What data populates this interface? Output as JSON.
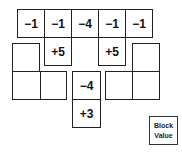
{
  "diagram": {
    "top_row": [
      "−1",
      "−1",
      "−4",
      "−1",
      "−1"
    ],
    "left_hanger": [
      "+5"
    ],
    "right_hanger": [
      "+5"
    ],
    "center_column": [
      "−4",
      "+3"
    ],
    "left_block_cells": [
      "",
      "",
      ""
    ],
    "right_block_cells": [
      "",
      "",
      ""
    ],
    "legend": {
      "line1": "Block",
      "line2": "Value"
    }
  }
}
